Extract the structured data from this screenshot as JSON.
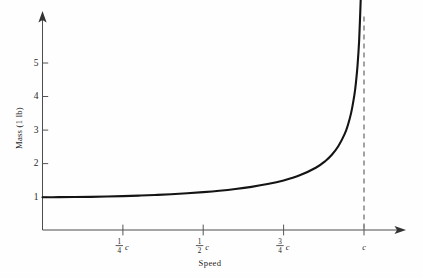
{
  "figure": {
    "background_color": "#fefefe",
    "curve_color": "#141414",
    "axis_color": "#4d4d4d",
    "asymptote_color": "#8c8c8c"
  },
  "chart_data": {
    "type": "line",
    "title": "",
    "subtitle": "",
    "xlabel": "Speed",
    "ylabel": "Mass (1 lb)",
    "xlim": [
      0,
      1.085
    ],
    "ylim": [
      0,
      6.05
    ],
    "grid": false,
    "legend": null,
    "x_tick_labels": [
      "1/4 c",
      "1/2 c",
      "3/4 c",
      "c"
    ],
    "x_tick_values": [
      0.25,
      0.5,
      0.75,
      1.0
    ],
    "x_tick_fractions": [
      {
        "numerator": "1",
        "denominator": "4",
        "symbol": "c"
      },
      {
        "numerator": "1",
        "denominator": "2",
        "symbol": "c"
      },
      {
        "numerator": "3",
        "denominator": "4",
        "symbol": "c"
      },
      {
        "numerator": "",
        "denominator": "",
        "symbol": "c"
      }
    ],
    "y_tick_labels": [
      "1",
      "2",
      "3",
      "4",
      "5"
    ],
    "y_tick_values": [
      1,
      2,
      3,
      4,
      5
    ],
    "series": [
      {
        "name": "Relativistic mass",
        "formula": "m = 1 / sqrt(1 - (v/c)^2)",
        "x": [
          0.0,
          0.05,
          0.1,
          0.15,
          0.2,
          0.25,
          0.3,
          0.35,
          0.4,
          0.45,
          0.5,
          0.55,
          0.6,
          0.65,
          0.7,
          0.75,
          0.8,
          0.85,
          0.88,
          0.9,
          0.92,
          0.94,
          0.95,
          0.96,
          0.97,
          0.975,
          0.98,
          0.985,
          0.99,
          0.993,
          0.995,
          0.996
        ],
        "values": [
          1.0,
          1.001,
          1.005,
          1.011,
          1.021,
          1.033,
          1.048,
          1.068,
          1.091,
          1.12,
          1.155,
          1.197,
          1.25,
          1.316,
          1.4,
          1.512,
          1.667,
          1.898,
          2.105,
          2.294,
          2.552,
          2.931,
          3.203,
          3.571,
          4.113,
          4.501,
          5.025,
          5.799,
          7.089,
          8.425,
          10.01,
          11.19
        ]
      }
    ],
    "annotations": [
      {
        "type": "vertical-asymptote",
        "label": "c",
        "x": 1.0,
        "style": "dashed"
      }
    ],
    "axis_arrows": {
      "x": "right",
      "y": "up"
    }
  },
  "labels": {
    "y_axis_title": "Mass (1 lb)",
    "x_axis_title": "Speed"
  },
  "icons": {
    "x_axis_arrow": "arrow-right-icon",
    "y_axis_arrow": "arrow-up-icon"
  }
}
